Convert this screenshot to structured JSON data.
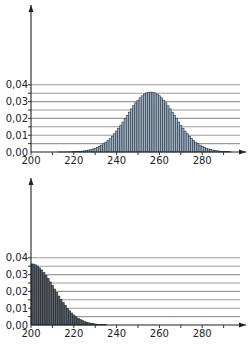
{
  "chart_data": [
    {
      "type": "bar",
      "title": "",
      "xlabel": "",
      "ylabel": "",
      "x_ticks": [
        200,
        220,
        240,
        260,
        280
      ],
      "x_minor_step": 10,
      "xlim": [
        200,
        298
      ],
      "y_ticks": [
        "0,00",
        "0,01",
        "0,02",
        "0,03",
        "0,04"
      ],
      "y_tick_values": [
        0,
        0.01,
        0.02,
        0.03,
        0.04
      ],
      "y_minor_gridlines": [
        0.005,
        0.015,
        0.025,
        0.035
      ],
      "ylim": [
        0,
        0.043
      ],
      "grid": true,
      "bar_fill": "#9fb0c2",
      "bar_stroke": "#1e2a36",
      "x_start": 200,
      "values": [
        0.0,
        0.0,
        0.0,
        0.0,
        0.0,
        0.0,
        0.0,
        0.0,
        0.0,
        0.0,
        0.0,
        0.0,
        0.0,
        1e-05,
        2e-05,
        3e-05,
        4e-05,
        6e-05,
        9e-05,
        0.00013,
        0.00018,
        0.00024,
        0.00032,
        0.00042,
        0.00054,
        0.0007,
        0.0009,
        0.00114,
        0.00143,
        0.00179,
        0.00223,
        0.00274,
        0.00335,
        0.00406,
        0.00488,
        0.00582,
        0.00689,
        0.00809,
        0.00942,
        0.01087,
        0.01246,
        0.01417,
        0.01597,
        0.01786,
        0.01981,
        0.02177,
        0.02374,
        0.02566,
        0.02752,
        0.02925,
        0.03084,
        0.03226,
        0.03346,
        0.03441,
        0.03511,
        0.03554,
        0.03568,
        0.03554,
        0.03511,
        0.03441,
        0.03346,
        0.03226,
        0.03084,
        0.02925,
        0.02752,
        0.02566,
        0.02374,
        0.02177,
        0.01981,
        0.01786,
        0.01597,
        0.01417,
        0.01246,
        0.01087,
        0.00942,
        0.00809,
        0.00689,
        0.00582,
        0.00488,
        0.00406,
        0.00335,
        0.00274,
        0.00223,
        0.00179,
        0.00143,
        0.00114,
        0.0009,
        0.0007,
        0.00054,
        0.00042,
        0.00032,
        0.00024,
        0.00018,
        0.00013
      ]
    },
    {
      "type": "bar",
      "title": "",
      "xlabel": "",
      "ylabel": "",
      "x_ticks": [
        200,
        220,
        240,
        260,
        280
      ],
      "x_minor_step": 10,
      "xlim": [
        200,
        298
      ],
      "y_ticks": [
        "0,00",
        "0,01",
        "0,02",
        "0,03",
        "0,04"
      ],
      "y_tick_values": [
        0,
        0.01,
        0.02,
        0.03,
        0.04
      ],
      "y_minor_gridlines": [
        0.005,
        0.015,
        0.025,
        0.035
      ],
      "ylim": [
        0,
        0.043
      ],
      "grid": true,
      "bar_fill": "#5a6068",
      "bar_stroke": "#1a1d22",
      "x_start": 200,
      "values": [
        0.03641,
        0.03626,
        0.0358,
        0.03504,
        0.03401,
        0.03272,
        0.0312,
        0.02948,
        0.0276,
        0.0256,
        0.02352,
        0.0214,
        0.01929,
        0.01722,
        0.01523,
        0.01334,
        0.01157,
        0.00994,
        0.00846,
        0.00713,
        0.00595,
        0.00492,
        0.00403,
        0.00327,
        0.00263,
        0.00209,
        0.00165,
        0.00129,
        0.001,
        0.00077,
        0.00058,
        0.00044,
        0.00033,
        0.00024,
        0.00018,
        0.00013
      ]
    }
  ]
}
